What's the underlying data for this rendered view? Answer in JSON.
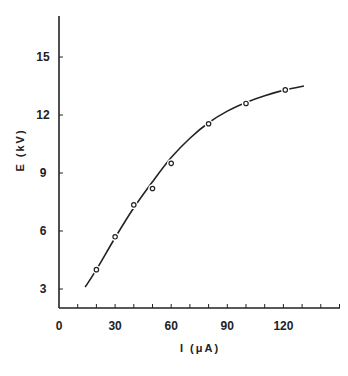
{
  "chart_data": {
    "type": "line",
    "title": "",
    "xlabel": "I   (μA)",
    "ylabel": "E   (kV)",
    "xlim": [
      0,
      140
    ],
    "ylim": [
      1.9,
      17
    ],
    "grid": false,
    "legend": null,
    "x_ticks": [
      0,
      30,
      60,
      90,
      120
    ],
    "x_tick_labels": [
      "0",
      "30",
      "60",
      "90",
      "120"
    ],
    "x_minor_tick_step": 10,
    "y_ticks": [
      3,
      6,
      9,
      12,
      15
    ],
    "y_tick_labels": [
      "3",
      "6",
      "9",
      "12",
      "15"
    ],
    "series": [
      {
        "name": "measured",
        "style": "open-circle markers",
        "x": [
          20,
          30,
          40,
          50,
          60,
          80,
          100,
          121
        ],
        "y": [
          4.0,
          5.7,
          7.35,
          8.2,
          9.5,
          11.55,
          12.6,
          13.3
        ]
      },
      {
        "name": "fitted curve",
        "style": "solid line",
        "x": [
          14,
          20,
          30,
          40,
          50,
          60,
          70,
          80,
          90,
          100,
          110,
          121,
          131
        ],
        "y": [
          3.1,
          4.0,
          5.65,
          7.2,
          8.55,
          9.8,
          10.8,
          11.6,
          12.2,
          12.65,
          13.0,
          13.3,
          13.5
        ]
      }
    ]
  },
  "labels": {
    "x_axis_title": "I   (μA)",
    "y_axis_title": "E   (kV)"
  }
}
